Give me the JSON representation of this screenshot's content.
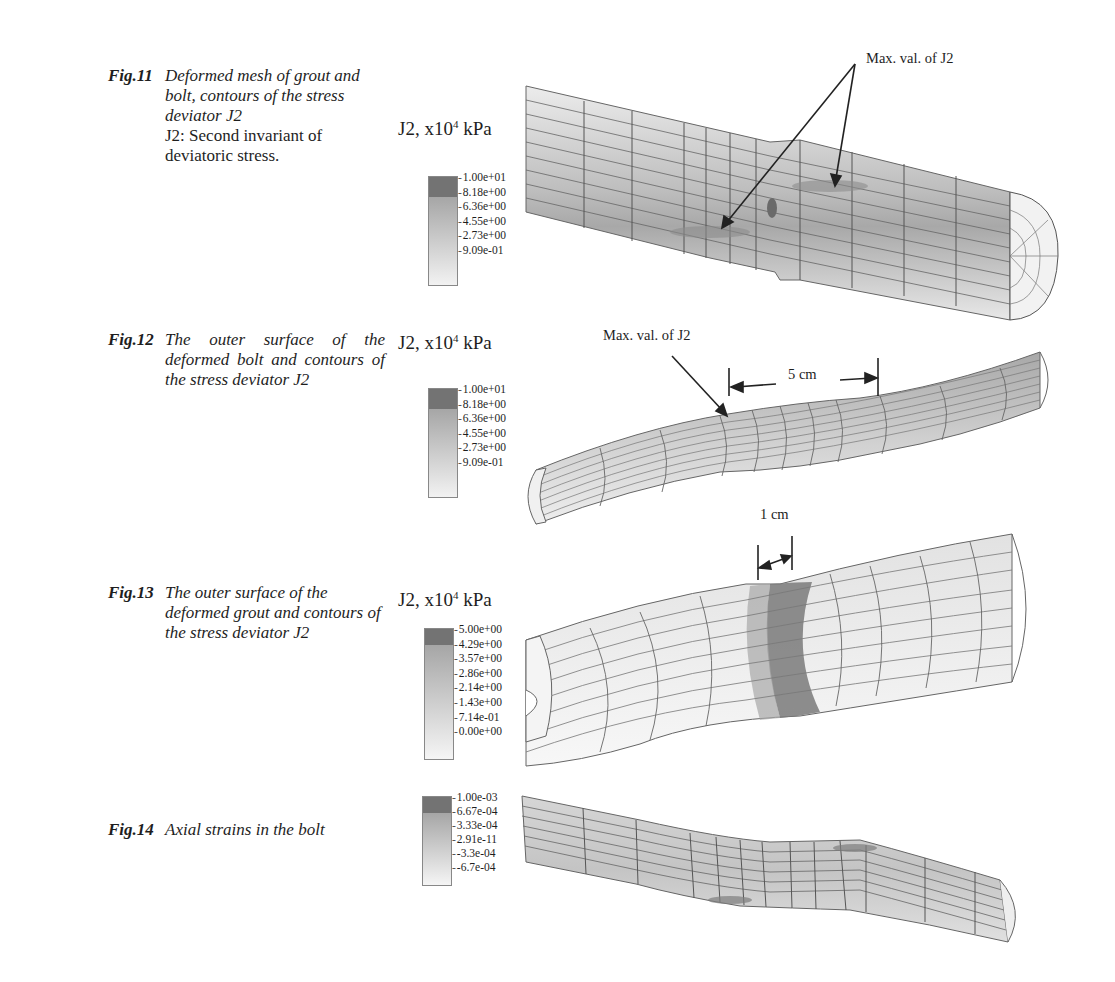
{
  "figures": [
    {
      "label": "Fig.11",
      "caption": "Deformed mesh of grout and bolt, contours of the stress deviator J2",
      "note": "J2: Second invariant of deviatoric stress.",
      "legend_title": "J2, x10",
      "legend_exp": "4",
      "legend_unit": " kPa",
      "legend_values": [
        "1.00e+01",
        "8.18e+00",
        "6.36e+00",
        "4.55e+00",
        "2.73e+00",
        "9.09e-01"
      ],
      "annotations": [
        "Max. val. of J2"
      ]
    },
    {
      "label": "Fig.12",
      "caption": "The outer surface of the deformed bolt and contours of the stress deviator J2",
      "legend_title": "J2, x10",
      "legend_exp": "4",
      "legend_unit": " kPa",
      "legend_values": [
        "1.00e+01",
        "8.18e+00",
        "6.36e+00",
        "4.55e+00",
        "2.73e+00",
        "9.09e-01"
      ],
      "annotations": [
        "Max. val. of J2",
        "5 cm"
      ]
    },
    {
      "label": "Fig.13",
      "caption": "The outer surface of the deformed grout and contours of the stress deviator J2",
      "legend_title": "J2, x10",
      "legend_exp": "4",
      "legend_unit": " kPa",
      "legend_values": [
        "5.00e+00",
        "4.29e+00",
        "3.57e+00",
        "2.86e+00",
        "2.14e+00",
        "1.43e+00",
        "7.14e-01",
        "0.00e+00"
      ],
      "annotations": [
        "1 cm"
      ]
    },
    {
      "label": "Fig.14",
      "caption": "Axial strains in the bolt",
      "legend_values": [
        "1.00e-03",
        "6.67e-04",
        "3.33e-04",
        "2.91e-11",
        "-3.3e-04",
        "-6.7e-04"
      ]
    }
  ],
  "colors": {
    "max_band": "#6f6f6f",
    "high_band": "#a9a9a9",
    "mid_band": "#c6c6c6",
    "low_band": "#e6e6e6",
    "mesh_line": "#555555"
  }
}
